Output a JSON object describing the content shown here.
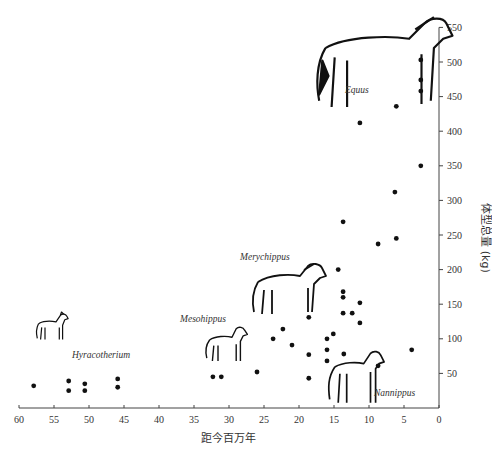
{
  "chart_data": {
    "type": "scatter",
    "title": "",
    "xlabel": "距今百万年",
    "ylabel": "体型总量 (kg)",
    "xlim": [
      60,
      0
    ],
    "ylim": [
      0,
      550
    ],
    "x_reversed": true,
    "y_axis_position": "right",
    "grid": false,
    "legend": "none",
    "xticks": [
      60,
      55,
      50,
      45,
      40,
      35,
      30,
      25,
      20,
      15,
      10,
      5,
      0
    ],
    "yticks": [
      50,
      100,
      150,
      200,
      250,
      300,
      350,
      400,
      450,
      500,
      550
    ],
    "points": [
      {
        "x": 57.9,
        "y": 32
      },
      {
        "x": 52.9,
        "y": 39
      },
      {
        "x": 52.9,
        "y": 25
      },
      {
        "x": 50.6,
        "y": 35
      },
      {
        "x": 50.6,
        "y": 25
      },
      {
        "x": 45.9,
        "y": 42
      },
      {
        "x": 45.9,
        "y": 30
      },
      {
        "x": 32.3,
        "y": 45
      },
      {
        "x": 31.1,
        "y": 45
      },
      {
        "x": 26.0,
        "y": 52
      },
      {
        "x": 23.7,
        "y": 100
      },
      {
        "x": 22.3,
        "y": 114
      },
      {
        "x": 21.0,
        "y": 91
      },
      {
        "x": 18.6,
        "y": 131
      },
      {
        "x": 18.6,
        "y": 77
      },
      {
        "x": 18.6,
        "y": 43
      },
      {
        "x": 16.0,
        "y": 100
      },
      {
        "x": 16.0,
        "y": 84
      },
      {
        "x": 16.0,
        "y": 68
      },
      {
        "x": 15.1,
        "y": 107
      },
      {
        "x": 14.4,
        "y": 200
      },
      {
        "x": 13.7,
        "y": 269
      },
      {
        "x": 13.7,
        "y": 168
      },
      {
        "x": 13.7,
        "y": 160
      },
      {
        "x": 13.7,
        "y": 137
      },
      {
        "x": 13.6,
        "y": 78
      },
      {
        "x": 12.4,
        "y": 137
      },
      {
        "x": 11.3,
        "y": 152
      },
      {
        "x": 11.3,
        "y": 123
      },
      {
        "x": 11.3,
        "y": 412
      },
      {
        "x": 8.7,
        "y": 237
      },
      {
        "x": 8.7,
        "y": 61
      },
      {
        "x": 6.1,
        "y": 436
      },
      {
        "x": 6.1,
        "y": 245
      },
      {
        "x": 6.3,
        "y": 312
      },
      {
        "x": 3.9,
        "y": 84
      },
      {
        "x": 2.6,
        "y": 350
      },
      {
        "x": 2.6,
        "y": 458
      },
      {
        "x": 2.6,
        "y": 474
      },
      {
        "x": 2.6,
        "y": 503
      }
    ],
    "annotations": [
      {
        "label": "Hyracotherium",
        "x": 43,
        "y": 70
      },
      {
        "label": "Mesohippus",
        "x": 31,
        "y": 125
      },
      {
        "label": "Merychippus",
        "x": 18,
        "y": 203
      },
      {
        "label": "Nannippus",
        "x": 7,
        "y": 25
      },
      {
        "label": "Equus",
        "x": 16,
        "y": 450
      }
    ]
  },
  "species_labels": {
    "hyracotherium": "Hyracotherium",
    "mesohippus": "Mesohippus",
    "merychippus": "Merychippus",
    "nannippus": "Nannippus",
    "equus": "Equus"
  },
  "axes": {
    "x_title": "距今百万年",
    "y_title": "体型总量 (kg)"
  }
}
